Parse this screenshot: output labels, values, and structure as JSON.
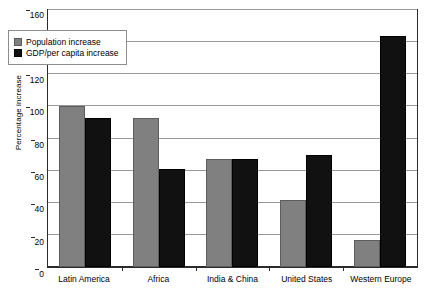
{
  "chart_data": {
    "type": "bar",
    "title": "",
    "xlabel": "",
    "ylabel": "Percentage increase",
    "categories": [
      "Latin America",
      "Africa",
      "India & China",
      "United States",
      "Western Europe"
    ],
    "series": [
      {
        "name": "Population increase",
        "color": "#808080",
        "values": [
          100,
          93,
          67,
          42,
          17
        ]
      },
      {
        "name": "GDP/per capita increase",
        "color": "#111111",
        "values": [
          93,
          61,
          67,
          70,
          144
        ]
      }
    ],
    "ylim": [
      0,
      160
    ],
    "ytick_step": 20,
    "yticks": [
      0,
      20,
      40,
      60,
      80,
      100,
      120,
      140,
      160
    ],
    "grid": true,
    "legend_position": "top-left-inside"
  },
  "legend": {
    "items": [
      {
        "label": "Population increase",
        "swatch": "gray-swatch"
      },
      {
        "label": "GDP/per capita increase",
        "swatch": "black-swatch"
      }
    ]
  }
}
